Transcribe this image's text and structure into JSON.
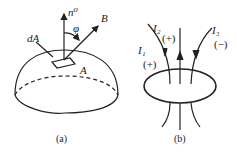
{
  "figure_a": {
    "caption": "(a)",
    "labels": {
      "normal": "n⁰",
      "field": "B",
      "angle": "φ",
      "element": "dA",
      "surface": "A"
    }
  },
  "figure_b": {
    "caption": "(b)",
    "currents": [
      {
        "name": "I₁",
        "sign": "(+)"
      },
      {
        "name": "I₂",
        "sign": "(+)"
      },
      {
        "name": "I₃",
        "sign": "(−)"
      }
    ]
  }
}
